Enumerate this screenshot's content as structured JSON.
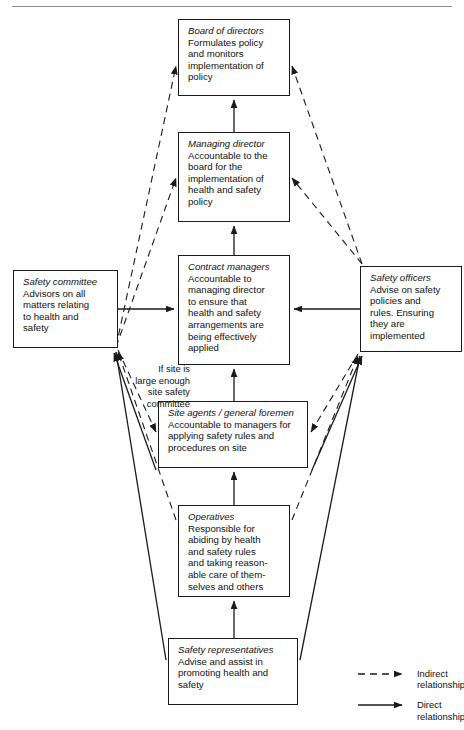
{
  "figure": {
    "type": "organisational-flow-diagram",
    "width": 464,
    "height": 730,
    "line_color": "#1a1a1a",
    "background": "#ffffff"
  },
  "nodes": [
    {
      "id": "board",
      "title": "Board of directors",
      "desc": "Formulates policy\nand monitors\nimplementation of\npolicy",
      "x": 178,
      "y": 19,
      "w": 112,
      "h": 77
    },
    {
      "id": "managing-director",
      "title": "Managing director",
      "desc": "Accountable to the\nboard for the\nimplementation of\nhealth and safety\npolicy",
      "x": 178,
      "y": 132,
      "h": 90,
      "w": 112
    },
    {
      "id": "contract-managers",
      "title": "Contract managers",
      "desc": "Accountable to\nmanaging director\nto ensure that\nhealth and safety\narrangements are\nbeing effectively\napplied",
      "x": 178,
      "y": 255,
      "w": 112,
      "h": 110
    },
    {
      "id": "safety-committee",
      "title": "Safety committee",
      "desc": "Advisors on all\nmatters relating\nto health and\nsafety",
      "x": 13,
      "y": 270,
      "w": 105,
      "h": 78
    },
    {
      "id": "safety-officers",
      "title": "Safety officers",
      "desc": "Advise on safety\npolicies and\nrules. Ensuring\nthey are\nimplemented",
      "x": 360,
      "y": 266,
      "w": 102,
      "h": 86
    },
    {
      "id": "site-agents",
      "title": "Site agents / general foremen",
      "desc": "Accountable to managers for\napplying safety rules and\nprocedures on site",
      "x": 158,
      "y": 401,
      "w": 150,
      "h": 67
    },
    {
      "id": "operatives",
      "title": "Operatives",
      "desc": "Responsible for\nabiding by health\nand safety rules\nand taking reason-\nable care of them-\nselves and others",
      "x": 178,
      "y": 505,
      "w": 112,
      "h": 92
    },
    {
      "id": "safety-representatives",
      "title": "Safety representatives",
      "desc": "Advise and assist in\npromoting health and\nsafety",
      "x": 168,
      "y": 638,
      "w": 130,
      "h": 67
    }
  ],
  "annotation": {
    "text": "If site is\nlarge enough\nsite safety\ncommittee",
    "x": 96,
    "y": 352,
    "w": 94
  },
  "legend": {
    "x": 358,
    "y": 668,
    "items": [
      {
        "style": "dashed",
        "label": "Indirect\nrelationship"
      },
      {
        "style": "solid",
        "label": "Direct\nrelationship"
      }
    ]
  },
  "edges": [
    {
      "from": "managing-director",
      "to": "board",
      "style": "solid",
      "path": "M 234,132 L 234,100"
    },
    {
      "from": "contract-managers",
      "to": "managing-director",
      "style": "solid",
      "path": "M 234,255 L 234,226"
    },
    {
      "from": "safety-committee",
      "to": "contract-managers",
      "style": "solid",
      "path": "M 118,309 L 174,309"
    },
    {
      "from": "safety-officers",
      "to": "contract-managers",
      "style": "solid",
      "path": "M 360,309 L 294,309"
    },
    {
      "from": "site-agents",
      "to": "contract-managers",
      "style": "solid",
      "path": "M 234,401 L 234,369"
    },
    {
      "from": "operatives",
      "to": "site-agents",
      "style": "solid",
      "path": "M 234,505 L 234,472"
    },
    {
      "from": "safety-representatives",
      "to": "operatives",
      "style": "solid",
      "path": "M 234,638 L 234,601"
    },
    {
      "from": "safety-committee",
      "to": "board",
      "style": "dashed",
      "path": "M 116,347 L 176,66"
    },
    {
      "from": "safety-committee",
      "to": "managing-director",
      "style": "dashed",
      "path": "M 116,347 L 176,178"
    },
    {
      "from": "safety-officers",
      "to": "board",
      "style": "dashed",
      "path": "M 362,264 L 292,66"
    },
    {
      "from": "safety-officers",
      "to": "managing-director",
      "style": "dashed",
      "path": "M 362,264 L 292,178"
    },
    {
      "from": "safety-committee",
      "to": "site-agents",
      "style": "dashed",
      "path": "M 118,350 L 156,432"
    },
    {
      "from": "safety-officers",
      "to": "site-agents",
      "style": "dashed",
      "path": "M 358,354 L 311,432"
    },
    {
      "from": "operatives",
      "to": "safety-committee",
      "style": "dashed",
      "path": "M 176,520 L 118,352"
    },
    {
      "from": "operatives",
      "to": "safety-officers",
      "style": "dashed",
      "path": "M 292,520 L 358,356"
    },
    {
      "from": "safety-representatives",
      "to": "safety-committee",
      "style": "solid",
      "path": "M 166,660 L 116,352"
    },
    {
      "from": "safety-representatives",
      "to": "safety-officers",
      "style": "solid",
      "path": "M 300,660 L 360,356"
    },
    {
      "from": "site-agents",
      "to": "safety-committee",
      "style": "solid",
      "path": "M 156,470 L 114,353"
    },
    {
      "from": "site-agents",
      "to": "safety-officers",
      "style": "solid",
      "path": "M 312,470 L 362,356"
    }
  ]
}
